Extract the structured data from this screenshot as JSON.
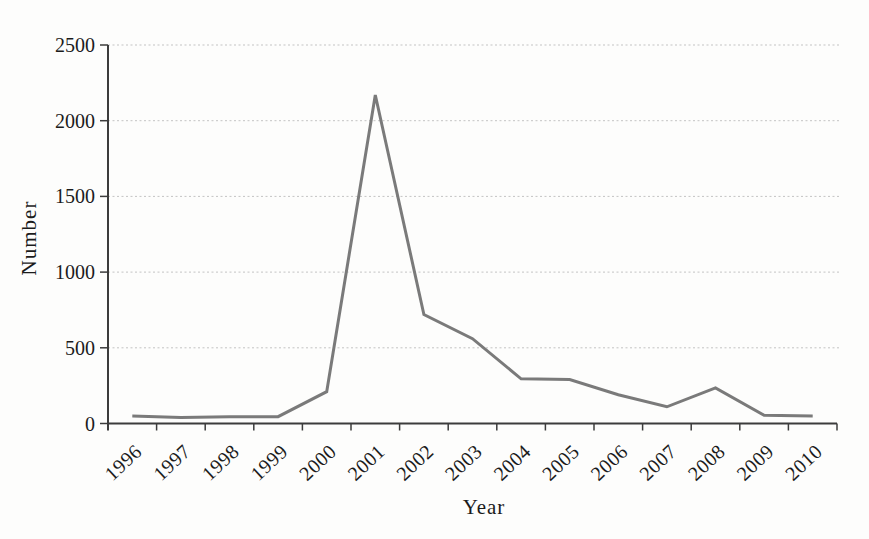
{
  "figure": {
    "xlabel": "Year",
    "ylabel": "Number"
  },
  "chart_data": {
    "type": "line",
    "title": "",
    "xlabel": "Year",
    "ylabel": "Number",
    "categories": [
      "1996",
      "1997",
      "1998",
      "1999",
      "2000",
      "2001",
      "2002",
      "2003",
      "2004",
      "2005",
      "2006",
      "2007",
      "2008",
      "2009",
      "2010"
    ],
    "series": [
      {
        "name": "Number",
        "values": [
          50,
          40,
          45,
          45,
          210,
          2170,
          720,
          560,
          295,
          290,
          190,
          110,
          235,
          55,
          50
        ]
      }
    ],
    "ylim": [
      0,
      2500
    ],
    "yticks": [
      0,
      500,
      1000,
      1500,
      2000,
      2500
    ],
    "grid": "horizontal-dashed",
    "legend": false,
    "colors": {
      "line": "#7a7a7a",
      "axis": "#3c3c3c",
      "gridline": "#c3c3c3",
      "text": "#1b1b1b",
      "background": "#fdfdfc"
    }
  }
}
